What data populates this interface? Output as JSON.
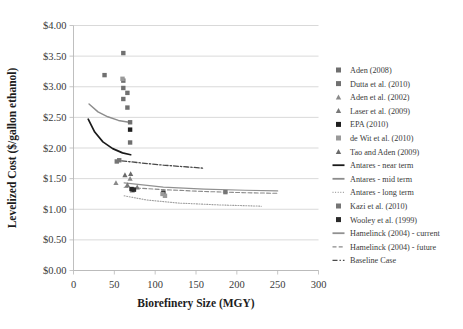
{
  "chart_data": {
    "type": "scatter",
    "title": "",
    "xlabel": "Biorefinery Size (MGY)",
    "ylabel": "Levelized Cost ($/gallon ethanol)",
    "xlim": [
      0,
      300
    ],
    "ylim": [
      0,
      4.0
    ],
    "xticks": [
      "0",
      "50",
      "100",
      "150",
      "200",
      "250",
      "300"
    ],
    "xtick_values": [
      0,
      50,
      100,
      150,
      200,
      250,
      300
    ],
    "yticks": [
      "$0.00",
      "$0.50",
      "$1.00",
      "$1.50",
      "$2.00",
      "$2.50",
      "$3.00",
      "$3.50",
      "$4.00"
    ],
    "ytick_values": [
      0,
      0.5,
      1.0,
      1.5,
      2.0,
      2.5,
      3.0,
      3.5,
      4.0
    ],
    "grid": "horizontal",
    "legend_position": "right",
    "series": [
      {
        "name": "Aden (2008)",
        "kind": "marker",
        "marker": "square",
        "color": "#6f6f6f",
        "points": [
          [
            69.3,
            2.42
          ],
          [
            69.3,
            2.09
          ]
        ]
      },
      {
        "name": "Dutta et al. (2010)",
        "kind": "marker",
        "marker": "square",
        "color": "#707070",
        "points": [
          [
            61.0,
            3.55
          ],
          [
            38.0,
            3.19
          ],
          [
            61.0,
            3.1
          ],
          [
            61.0,
            2.98
          ],
          [
            66.0,
            2.9
          ],
          [
            61.0,
            2.8
          ],
          [
            66.0,
            2.66
          ]
        ]
      },
      {
        "name": "Aden et al. (2002)",
        "kind": "marker",
        "marker": "triangle",
        "color": "#8a8a8a",
        "points": [
          [
            69.3,
            1.5
          ],
          [
            52.0,
            1.43
          ]
        ]
      },
      {
        "name": "Laser et al. (2009)",
        "kind": "marker",
        "marker": "triangle",
        "color": "#787878",
        "points": [
          [
            66.0,
            1.4
          ],
          [
            78.0,
            1.36
          ],
          [
            72.0,
            1.31
          ]
        ]
      },
      {
        "name": "EPA (2010)",
        "kind": "marker",
        "marker": "square",
        "color": "#1f1f1f",
        "points": [
          [
            69.3,
            2.3
          ],
          [
            110.0,
            1.27
          ]
        ]
      },
      {
        "name": "de Wit et al. (2010)",
        "kind": "marker",
        "marker": "square",
        "color": "#9a9a9a",
        "points": [
          [
            60.0,
            3.13
          ],
          [
            109.0,
            1.25
          ],
          [
            112.0,
            1.22
          ]
        ]
      },
      {
        "name": "Tao and Aden (2009)",
        "kind": "marker",
        "marker": "triangle",
        "color": "#6a6a6a",
        "points": [
          [
            63.0,
            1.56
          ],
          [
            70.0,
            1.58
          ]
        ]
      },
      {
        "name": "Antares - near term",
        "kind": "line",
        "style": "solid",
        "color": "#1a1a1a",
        "width": 1.7,
        "points": [
          [
            18.0,
            2.47
          ],
          [
            26.0,
            2.26
          ],
          [
            36.0,
            2.1
          ],
          [
            48.0,
            1.99
          ],
          [
            60.0,
            1.92
          ],
          [
            70.0,
            1.89
          ]
        ]
      },
      {
        "name": "Antares - mid term",
        "kind": "line",
        "style": "solid",
        "color": "#8c8c8c",
        "width": 1.4,
        "points": [
          [
            19.0,
            2.72
          ],
          [
            30.0,
            2.59
          ],
          [
            42.0,
            2.51
          ],
          [
            55.0,
            2.45
          ],
          [
            68.0,
            2.42
          ]
        ]
      },
      {
        "name": "Antares - long term",
        "kind": "line",
        "style": "dotted",
        "color": "#9e9e9e",
        "width": 1.1,
        "points": [
          [
            62.0,
            1.22
          ],
          [
            90.0,
            1.15
          ],
          [
            130.0,
            1.1
          ],
          [
            180.0,
            1.07
          ],
          [
            230.0,
            1.05
          ]
        ]
      },
      {
        "name": "Kazi et al. (2010)",
        "kind": "marker",
        "marker": "square",
        "color": "#757575",
        "points": [
          [
            186.0,
            1.28
          ],
          [
            53.0,
            1.78
          ],
          [
            56.0,
            1.8
          ]
        ]
      },
      {
        "name": "Wooley et al. (1999)",
        "kind": "marker",
        "marker": "square",
        "color": "#2a2a2a",
        "points": [
          [
            71.0,
            1.33
          ],
          [
            74.0,
            1.32
          ]
        ]
      },
      {
        "name": "Hamelinck (2004) - current",
        "kind": "line",
        "style": "solid",
        "color": "#919191",
        "width": 1.2,
        "points": [
          [
            62.0,
            1.43
          ],
          [
            110.0,
            1.36
          ],
          [
            160.0,
            1.33
          ],
          [
            210.0,
            1.31
          ],
          [
            250.0,
            1.3
          ]
        ]
      },
      {
        "name": "Hamelinck (2004) - future",
        "kind": "line",
        "style": "dashed",
        "color": "#8a8a8a",
        "width": 1.1,
        "points": [
          [
            62.0,
            1.36
          ],
          [
            110.0,
            1.32
          ],
          [
            160.0,
            1.29
          ],
          [
            210.0,
            1.27
          ],
          [
            250.0,
            1.26
          ]
        ]
      },
      {
        "name": "Baseline Case",
        "kind": "line",
        "style": "dashdot",
        "color": "#4a4a4a",
        "width": 1.3,
        "points": [
          [
            59.0,
            1.79
          ],
          [
            80.0,
            1.76
          ],
          [
            110.0,
            1.72
          ],
          [
            140.0,
            1.69
          ],
          [
            160.0,
            1.67
          ]
        ]
      }
    ]
  },
  "legend": {
    "items": [
      {
        "label": "Aden (2008)",
        "kind": "marker",
        "marker": "square",
        "color": "#6f6f6f"
      },
      {
        "label": "Dutta et al. (2010)",
        "kind": "marker",
        "marker": "square",
        "color": "#707070"
      },
      {
        "label": "Aden et al. (2002)",
        "kind": "marker",
        "marker": "triangle",
        "color": "#8a8a8a"
      },
      {
        "label": "Laser et al. (2009)",
        "kind": "marker",
        "marker": "triangle",
        "color": "#787878"
      },
      {
        "label": "EPA (2010)",
        "kind": "marker",
        "marker": "square",
        "color": "#1f1f1f"
      },
      {
        "label": "de Wit et al. (2010)",
        "kind": "marker",
        "marker": "square",
        "color": "#9a9a9a"
      },
      {
        "label": "Tao and Aden (2009)",
        "kind": "marker",
        "marker": "triangle",
        "color": "#6a6a6a"
      },
      {
        "label": "Antares - near term",
        "kind": "line",
        "style": "solid",
        "color": "#1a1a1a"
      },
      {
        "label": "Antares - mid term",
        "kind": "line",
        "style": "solid",
        "color": "#8c8c8c"
      },
      {
        "label": "Antares - long term",
        "kind": "line",
        "style": "dotted",
        "color": "#9e9e9e"
      },
      {
        "label": "Kazi et al. (2010)",
        "kind": "marker",
        "marker": "square",
        "color": "#757575"
      },
      {
        "label": "Wooley et al. (1999)",
        "kind": "marker",
        "marker": "square",
        "color": "#2a2a2a"
      },
      {
        "label": "Hamelinck (2004) - current",
        "kind": "line",
        "style": "solid",
        "color": "#919191"
      },
      {
        "label": "Hamelinck (2004) - future",
        "kind": "line",
        "style": "dashed",
        "color": "#8a8a8a"
      },
      {
        "label": "Baseline Case",
        "kind": "line",
        "style": "dashdot",
        "color": "#4a4a4a"
      }
    ]
  },
  "colors": {
    "background": "#ffffff",
    "grid": "#c9c9c9",
    "text": "#3a3a3a"
  }
}
